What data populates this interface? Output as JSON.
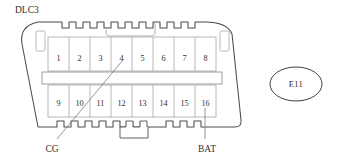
{
  "diagram": {
    "title": "DLC3",
    "connector_name": "DLC3",
    "connector_code": "E11",
    "pin_rows": [
      {
        "row": "top",
        "pins": [
          "1",
          "2",
          "3",
          "4",
          "5",
          "6",
          "7",
          "8"
        ]
      },
      {
        "row": "bottom",
        "pins": [
          "9",
          "10",
          "11",
          "12",
          "13",
          "14",
          "15",
          "16"
        ]
      }
    ],
    "callouts": [
      {
        "label": "CG",
        "pin": "4",
        "position": "bottom-left"
      },
      {
        "label": "BAT",
        "pin": "16",
        "position": "bottom-right"
      }
    ],
    "colors": {
      "background": "#ffffff",
      "outline": "#4a4a4a",
      "grid": "#a0a0a0",
      "text": "#2f2f2f",
      "leader": "#7a7a7a"
    }
  }
}
